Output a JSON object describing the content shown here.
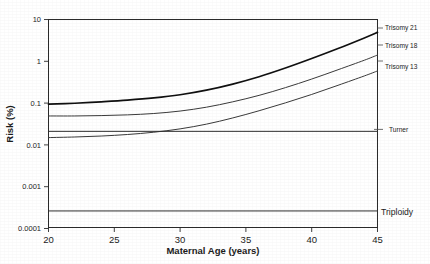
{
  "chart_data": {
    "type": "line",
    "title": "",
    "xlabel": "Maternal Age (years)",
    "ylabel": "Risk (%)",
    "yscale": "log",
    "ylim": [
      0.0001,
      10
    ],
    "xlim": [
      20,
      45
    ],
    "grid": false,
    "legend_position": "right-inline",
    "xticks": [
      "20",
      "25",
      "30",
      "35",
      "40",
      "45"
    ],
    "xtick_values": [
      20,
      25,
      30,
      35,
      40,
      45
    ],
    "yticks": [
      "10",
      "1",
      "0.1",
      "0.01",
      "0.001",
      "0.0001"
    ],
    "ytick_values": [
      10,
      1,
      0.1,
      0.01,
      0.001,
      0.0001
    ],
    "x": [
      20,
      22,
      24,
      26,
      28,
      30,
      32,
      34,
      36,
      38,
      40,
      42,
      44,
      45
    ],
    "series": [
      {
        "name": "Trisomy 21",
        "label": "Trisomy 21",
        "emphasis": "bold",
        "color": "#101010",
        "values": [
          0.092,
          0.097,
          0.105,
          0.115,
          0.13,
          0.155,
          0.2,
          0.28,
          0.42,
          0.68,
          1.15,
          2.0,
          3.6,
          4.9
        ]
      },
      {
        "name": "Trisomy 18",
        "label": "Trisomy 18",
        "emphasis": "normal",
        "color": "#3a3a3a",
        "values": [
          0.048,
          0.048,
          0.049,
          0.051,
          0.055,
          0.063,
          0.078,
          0.105,
          0.15,
          0.23,
          0.37,
          0.62,
          1.05,
          1.4
        ]
      },
      {
        "name": "Trisomy 13",
        "label": "Trisomy 13",
        "emphasis": "normal",
        "color": "#3a3a3a",
        "values": [
          0.0145,
          0.015,
          0.0158,
          0.0172,
          0.0195,
          0.0235,
          0.0305,
          0.043,
          0.064,
          0.099,
          0.158,
          0.262,
          0.44,
          0.58
        ]
      },
      {
        "name": "Turner",
        "label": "Turner",
        "emphasis": "flat",
        "color": "#2e2e2e",
        "constant": 0.0205,
        "values": [
          0.0205,
          0.0205,
          0.0205,
          0.0205,
          0.0205,
          0.0205,
          0.0205,
          0.0205,
          0.0205,
          0.0205,
          0.0205,
          0.0205,
          0.0205,
          0.0205
        ]
      },
      {
        "name": "Triploidy",
        "label": "Triploidy",
        "emphasis": "flat",
        "color": "#2e2e2e",
        "constant": 0.00025,
        "values": [
          0.00025,
          0.00025,
          0.00025,
          0.00025,
          0.00025,
          0.00025,
          0.00025,
          0.00025,
          0.00025,
          0.00025,
          0.00025,
          0.00025,
          0.00025,
          0.00025
        ]
      }
    ]
  }
}
